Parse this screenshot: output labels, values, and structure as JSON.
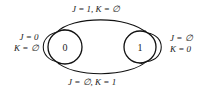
{
  "diagram": {
    "type": "state-transition-diagram",
    "colors": {
      "stroke": "#111111",
      "text": "#1a1a1a",
      "background": "#ffffff"
    },
    "states": [
      {
        "id": "s0",
        "label": "0",
        "cx": 65,
        "cy": 47,
        "r": 17
      },
      {
        "id": "s1",
        "label": "1",
        "cx": 140,
        "cy": 47,
        "r": 16
      }
    ],
    "transitions": [
      {
        "id": "t-self-0",
        "from": "s0",
        "to": "s0",
        "kind": "self-loop",
        "side": "left",
        "label_lines": [
          "J = 0",
          "K = ∅"
        ]
      },
      {
        "id": "t-0-to-1",
        "from": "s0",
        "to": "s1",
        "kind": "arc",
        "side": "top",
        "label_lines": [
          "J = 1, K = ∅"
        ]
      },
      {
        "id": "t-1-to-0",
        "from": "s1",
        "to": "s0",
        "kind": "arc",
        "side": "bottom",
        "label_lines": [
          "J = ∅, K = 1"
        ]
      },
      {
        "id": "t-self-1",
        "from": "s1",
        "to": "s1",
        "kind": "self-loop",
        "side": "right",
        "label_lines": [
          "J = ∅",
          "K = 0"
        ]
      }
    ],
    "labels": {
      "self_loop_left_line1": "J = 0",
      "self_loop_left_line2": "K = ∅",
      "self_loop_right_line1": "J = ∅",
      "self_loop_right_line2": "K = 0",
      "top_transition": "J = 1, K = ∅",
      "bottom_transition": "J = ∅, K = 1"
    },
    "state_labels": {
      "left": "0",
      "right": "1"
    }
  }
}
